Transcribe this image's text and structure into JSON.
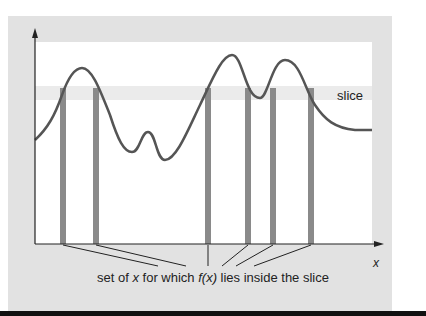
{
  "diagram": {
    "title": "",
    "slice_label": "slice",
    "x_axis_label": "x",
    "caption": {
      "part1": "set of ",
      "var": "x",
      "part2": " for which ",
      "func": "f(x)",
      "part3": " lies inside the slice"
    },
    "colors": {
      "panel": "#e2e2e2",
      "plot_bg": "#ffffff",
      "slice_band": "#ebebeb",
      "curve": "#555555",
      "bars": "#8a8a8a",
      "axes": "#222222"
    },
    "bars_x": [
      63,
      96,
      208,
      248,
      273,
      311
    ],
    "slice_band": {
      "y_top": 86,
      "y_bottom": 100
    }
  }
}
